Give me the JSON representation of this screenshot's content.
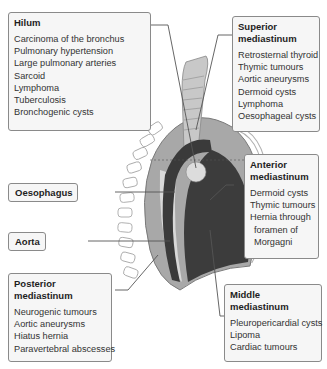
{
  "boxes": {
    "hilum": {
      "title": "Hilum",
      "items": [
        "Carcinoma of the bronchus",
        "Pulmonary hypertension",
        "Large pulmonary arteries",
        "Sarcoid",
        "Lymphoma",
        "Tuberculosis",
        "Bronchogenic cysts"
      ]
    },
    "superior": {
      "title_line1": "Superior",
      "title_line2": "mediastinum",
      "items": [
        "Retrosternal thyroid",
        "Thymic tumours",
        "Aortic aneurysms",
        "Dermoid cysts",
        "Lymphoma",
        "Oesophageal cysts"
      ]
    },
    "anterior": {
      "title_line1": "Anterior",
      "title_line2": "mediastinum",
      "items": [
        "Dermoid cysts",
        "Thymic tumours",
        "Hernia through",
        "foramen of",
        "Morgagni"
      ]
    },
    "oesophagus": {
      "title": "Oesophagus"
    },
    "aorta": {
      "title": "Aorta"
    },
    "posterior": {
      "title_line1": "Posterior",
      "title_line2": "mediastinum",
      "items": [
        "Neurogenic tumours",
        "Aortic aneurysms",
        "Hiatus hernia",
        "Paravertebral abscesses"
      ]
    },
    "middle": {
      "title_line1": "Middle",
      "title_line2": "mediastinum",
      "items": [
        "Pleuropericardial cysts",
        "Lipoma",
        "Cardiac tumours"
      ]
    }
  },
  "colors": {
    "box_bg": "#f6f6f6",
    "box_border": "#8a8a8a",
    "outer_region": "#a8a8a8",
    "middle_region": "#3c3c3c",
    "light_region": "#d8d8d8",
    "leader_line": "#555555"
  }
}
